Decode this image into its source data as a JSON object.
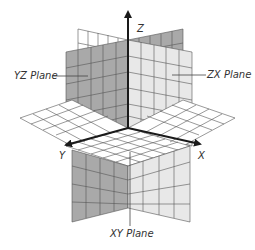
{
  "diagram": {
    "type": "3d-coordinate-planes",
    "axes": {
      "x": {
        "label": "X"
      },
      "y": {
        "label": "Y"
      },
      "z": {
        "label": "Z"
      }
    },
    "planes": {
      "yz": {
        "label": "YZ Plane",
        "fill": "#a9a9a9"
      },
      "zx": {
        "label": "ZX Plane",
        "fill": "#e4e4e4"
      },
      "xy": {
        "label": "XY Plane",
        "fill": "#ffffff"
      }
    },
    "colors": {
      "grid_line": "#555555",
      "axis": "#1a1a1a",
      "label_text": "#333333",
      "leader_line": "#444444"
    }
  }
}
